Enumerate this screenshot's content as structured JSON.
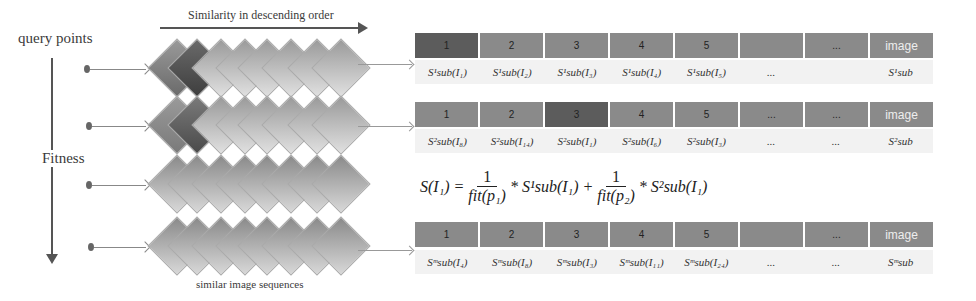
{
  "labels": {
    "query_points": "query points",
    "similarity_order": "Similarity in descending order",
    "fitness": "Fitness",
    "sequences": "similar image  sequences"
  },
  "colors": {
    "cell_default": "#8a8a8a",
    "cell_highlight_dark": "#5a5a5a",
    "diamond_light": "#c8c8c8",
    "diamond_mid": "#8c8c8c",
    "diamond_dark": "#555555"
  },
  "rows": [
    {
      "id": "row1",
      "header": [
        "1",
        "2",
        "3",
        "4",
        "5",
        "",
        "...",
        "image"
      ],
      "highlight_index": 0,
      "scores": [
        "S¹sub(I₁)",
        "S¹sub(I₂)",
        "S¹sub(I₃)",
        "S¹sub(I₄)",
        "S¹sub(I₅)",
        "...",
        "",
        "S¹sub"
      ]
    },
    {
      "id": "row2",
      "header": [
        "1",
        "2",
        "3",
        "4",
        "5",
        "...",
        "...",
        "image"
      ],
      "highlight_index": 2,
      "scores": [
        "S²sub(I₈)",
        "S²sub(I₁₄)",
        "S²sub(I₁)",
        "S²sub(I₆)",
        "S²sub(I₃)",
        "...",
        "...",
        "S²sub"
      ]
    },
    {
      "id": "rowm",
      "header": [
        "1",
        "2",
        "3",
        "4",
        "5",
        "",
        "...",
        "image"
      ],
      "highlight_index": -1,
      "scores": [
        "Sᵐsub(I₄)",
        "Sᵐsub(I₈)",
        "Sᵐsub(I₃)",
        "Sᵐsub(I₁₁)",
        "Sᵐsub(I₂₄)",
        "...",
        "...",
        "Sᵐsub"
      ]
    }
  ],
  "formula": {
    "lhs": "S(I₁) =",
    "num1": "1",
    "den1": "fit(p₁)",
    "term1": "* S¹sub(I₁) +",
    "num2": "1",
    "den2": "fit(p₂)",
    "term2": "* S²sub(I₁)"
  }
}
